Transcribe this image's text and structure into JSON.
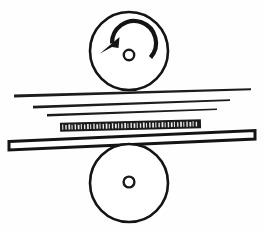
{
  "figure": {
    "background_color": "#fefefe",
    "ink_color": "#141414",
    "width": 264,
    "height": 230
  },
  "top_roller": {
    "label": "Top roll",
    "center_x": 129,
    "center_y": 51,
    "radius": 39,
    "stroke_width": 2.6,
    "fill": "#ffffff",
    "axle": {
      "label": "Top roll axle",
      "center_x": 129,
      "center_y": 55,
      "radius": 5.2
    },
    "rotation": {
      "label": "Counterclockwise rotation",
      "direction": "counterclockwise",
      "arc_radius": 22,
      "arc_stroke_width": 4.2,
      "arrow_head_points": "101.5,50.5 118.5,38.5 118.0,47.5 113.5,48.5"
    }
  },
  "bottom_roller": {
    "label": "Bottom roll",
    "center_x": 129,
    "center_y": 183,
    "radius": 39,
    "stroke_width": 2.6,
    "fill": "#ffffff",
    "axle": {
      "label": "Bottom roll axle",
      "center_x": 129,
      "center_y": 182,
      "radius": 5.4
    }
  },
  "strip_lines": [
    {
      "label": "Upper strip line",
      "x_left": 14,
      "x_right": 251,
      "y_left": 96,
      "y_right": 89,
      "thickness_left": 3.0,
      "thickness_right": 2.0
    },
    {
      "label": "Middle strip line",
      "x_left": 33,
      "x_right": 230,
      "y_left": 107,
      "y_right": 100,
      "thickness_left": 2.6,
      "thickness_right": 1.7
    },
    {
      "label": "Lower strip line",
      "x_left": 47,
      "x_right": 217,
      "y_left": 115,
      "y_right": 109,
      "thickness_left": 2.4,
      "thickness_right": 1.5
    }
  ],
  "knurled_band": {
    "label": "Textured workpiece band",
    "x": 60,
    "y": 121,
    "width": 141,
    "height": 9,
    "tilt_deg": -1.4,
    "fill": "#1b1b1b",
    "tooth_fill": "#e8e8e8",
    "tooth_count": 44
  },
  "plate": {
    "label": "Rolled plate bar",
    "fill": "#ffffff",
    "stroke_width": 3.0,
    "outline_points": "9,141.5 255,130.5 255,139.0 9,150.0"
  },
  "accessibility": {
    "description": "Technical line drawing: a counterclockwise-rotating top roll above a stack of thin strip lines, a dark knurled band, a hollow tilted plate bar, and a plain bottom roll."
  }
}
